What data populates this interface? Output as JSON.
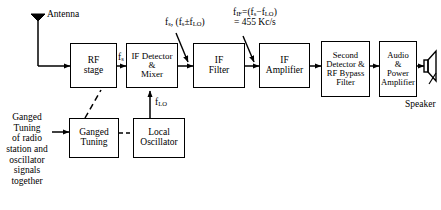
{
  "diagram": {
    "type": "block-diagram",
    "background": "#ffffff",
    "line_color": "#000000"
  },
  "blocks": [
    {
      "id": "rf-stage",
      "label_lines": [
        "RF",
        "stage"
      ]
    },
    {
      "id": "if-detector-mixer",
      "label_lines": [
        "IF Detector",
        "&",
        "Mixer"
      ]
    },
    {
      "id": "if-filter",
      "label_lines": [
        "IF",
        "Filter"
      ]
    },
    {
      "id": "if-amplifier",
      "label_lines": [
        "IF",
        "Amplifier"
      ]
    },
    {
      "id": "second-detector",
      "label_lines": [
        "Second",
        "Detector &",
        "RF Bypass",
        "Filter"
      ]
    },
    {
      "id": "audio-power-amp",
      "label_lines": [
        "Audio",
        "&",
        "Power",
        "Amplifier"
      ]
    },
    {
      "id": "ganged-tuning",
      "label_lines": [
        "Ganged",
        "Tuning"
      ]
    },
    {
      "id": "local-oscillator",
      "label_lines": [
        "Local",
        "Oscillator"
      ]
    }
  ],
  "labels": {
    "antenna": "Antenna",
    "speaker": "Speaker",
    "fs_rf_out": "f",
    "fs_rf_out_sub": "s",
    "mixer_out_1": "f",
    "mixer_out_1_sub": "s",
    "mixer_out_2": ", (f",
    "mixer_out_3": "±f",
    "mixer_out_4": ")",
    "flo": "f",
    "flo_sub": "LO",
    "if_line1_a": "f",
    "if_line1_sub": "IF",
    "if_line1_b": "=(f",
    "if_line1_c": "−f",
    "if_line1_d": ")",
    "if_line2": "= 455 Kc/s",
    "ganged_note_lines": [
      "Ganged",
      "Tuning",
      "of radio",
      "station and",
      "oscillator",
      "signals",
      "together"
    ]
  },
  "signals": {
    "rf_output": "fs",
    "mixer_output": "fs, (fs±fLO)",
    "local_oscillator": "fLO",
    "intermediate_frequency": "fIF=(fs−fLO) = 455 Kc/s",
    "if_value": "455 Kc/s"
  }
}
